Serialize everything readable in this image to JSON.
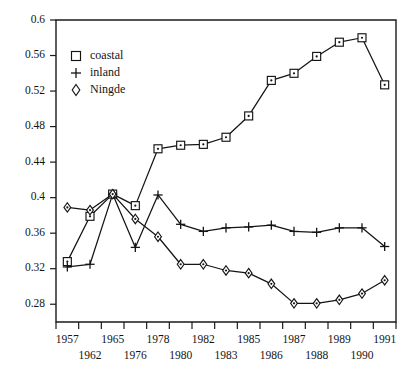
{
  "chart_data": {
    "type": "line",
    "title": "",
    "subtitle": "",
    "xlabel": "",
    "ylabel": "",
    "grid": false,
    "legend_position": "top-left",
    "categories": [
      "1957",
      "1962",
      "1965",
      "1976",
      "1978",
      "1980",
      "1982",
      "1983",
      "1985",
      "1986",
      "1987",
      "1988",
      "1989",
      "1990",
      "1991"
    ],
    "xtick_labels_row1": [
      "1957",
      "",
      "1965",
      "",
      "1978",
      "",
      "1982",
      "",
      "1985",
      "",
      "1987",
      "",
      "1989",
      "",
      "1991"
    ],
    "xtick_labels_row2": [
      "",
      "1962",
      "",
      "1976",
      "",
      "1980",
      "",
      "1983",
      "",
      "1986",
      "",
      "1988",
      "",
      "1990",
      ""
    ],
    "ylim": [
      0.26,
      0.6
    ],
    "ytick_values": [
      0.28,
      0.32,
      0.36,
      0.4,
      0.44,
      0.48,
      0.52,
      0.56,
      0.6
    ],
    "ytick_labels": [
      "0.28",
      "0.32",
      "0.36",
      "0.4",
      "0.44",
      "0.48",
      "0.52",
      "0.56",
      "0.6"
    ],
    "series": [
      {
        "name": "coastal",
        "marker": "square",
        "values": [
          0.328,
          0.379,
          0.404,
          0.391,
          0.455,
          0.459,
          0.46,
          0.468,
          0.492,
          0.532,
          0.54,
          0.559,
          0.575,
          0.58,
          0.527
        ]
      },
      {
        "name": "inland",
        "marker": "plus",
        "values": [
          0.322,
          0.325,
          0.404,
          0.344,
          0.403,
          0.37,
          0.362,
          0.366,
          0.367,
          0.369,
          0.362,
          0.361,
          0.366,
          0.366,
          0.345
        ]
      },
      {
        "name": "Ningde",
        "marker": "diamond",
        "values": [
          0.389,
          0.386,
          0.404,
          0.376,
          0.356,
          0.325,
          0.325,
          0.318,
          0.315,
          0.303,
          0.281,
          0.281,
          0.285,
          0.292,
          0.307
        ]
      }
    ]
  },
  "legend": {
    "items": [
      {
        "label": "coastal",
        "marker": "square"
      },
      {
        "label": "inland",
        "marker": "plus"
      },
      {
        "label": "Ningde",
        "marker": "diamond"
      }
    ]
  }
}
